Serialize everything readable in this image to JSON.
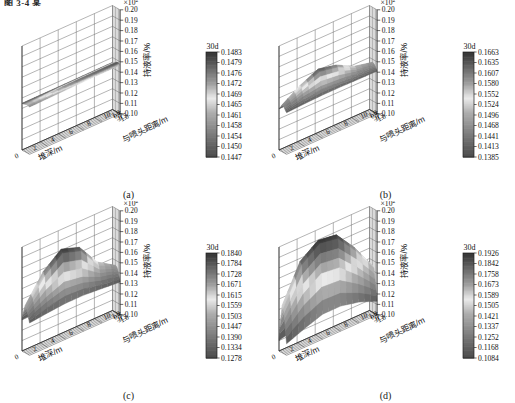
{
  "figure": {
    "cropped_header": "图 3-4 某  ",
    "axis_labels": {
      "x": "堆深/m",
      "y": "与喷头距离/m",
      "z": "持液率/%"
    },
    "z_multiplier": "×10",
    "z_multiplier_exp": "2",
    "x_ticks": [
      "0",
      "2",
      "4",
      "6",
      "8",
      "10"
    ],
    "y_ticks": [
      "1.0",
      "0.5",
      "0",
      "-0.5",
      "-1.0"
    ],
    "z_ticks": [
      "0.20",
      "0.19",
      "0.18",
      "0.17",
      "0.16",
      "0.15",
      "0.14",
      "0.13",
      "0.12",
      "0.11",
      "0.10"
    ],
    "colorbar_title": "30d"
  },
  "chart_data": [
    {
      "type": "heatmap",
      "panel": "a",
      "caption": "(a)",
      "title": "",
      "xlabel": "堆深/m",
      "ylabel": "与喷头距离/m",
      "zlabel": "持液率/%",
      "xlim": [
        0,
        10
      ],
      "ylim": [
        -1.0,
        1.0
      ],
      "zlim": [
        0.1,
        0.2
      ],
      "z_scale": "x10^2",
      "grid": true,
      "legend": "30d",
      "colorbar_ticks": [
        0.1483,
        0.1479,
        0.1476,
        0.1472,
        0.1469,
        0.1465,
        0.1461,
        0.1458,
        0.1454,
        0.145,
        0.1447
      ],
      "colorbar_min": 0.1447,
      "colorbar_max": 0.1483,
      "surface_description": "nearly flat plane at approximately 0.145-0.148, slight rise at the near-left corner",
      "surface_z_values": [
        [
          0.145,
          0.145,
          0.1451,
          0.1452,
          0.1453,
          0.1454
        ],
        [
          0.1452,
          0.1453,
          0.1455,
          0.1457,
          0.1458,
          0.1459
        ],
        [
          0.1458,
          0.1462,
          0.1466,
          0.1468,
          0.1469,
          0.147
        ],
        [
          0.1462,
          0.1468,
          0.1474,
          0.1477,
          0.1478,
          0.1479
        ],
        [
          0.146,
          0.1466,
          0.1472,
          0.1476,
          0.1478,
          0.148
        ],
        [
          0.1455,
          0.1458,
          0.1462,
          0.1465,
          0.1467,
          0.1469
        ]
      ]
    },
    {
      "type": "heatmap",
      "panel": "b",
      "caption": "(b)",
      "title": "",
      "xlabel": "堆深/m",
      "ylabel": "与喷头距离/m",
      "zlabel": "持液率/%",
      "xlim": [
        0,
        10
      ],
      "ylim": [
        -1.0,
        1.0
      ],
      "zlim": [
        0.1,
        0.2
      ],
      "z_scale": "x10^2",
      "grid": true,
      "legend": "30d",
      "colorbar_ticks": [
        0.1663,
        0.1635,
        0.1607,
        0.158,
        0.1552,
        0.1524,
        0.1496,
        0.1468,
        0.1441,
        0.1413,
        0.1385
      ],
      "colorbar_min": 0.1385,
      "colorbar_max": 0.1663,
      "surface_description": "localized peak near shallow depth at the nozzle centre, decaying to a flat plateau",
      "surface_z_values": [
        [
          0.1395,
          0.14,
          0.1405,
          0.1408,
          0.141,
          0.1412
        ],
        [
          0.142,
          0.146,
          0.148,
          0.147,
          0.145,
          0.1435
        ],
        [
          0.145,
          0.156,
          0.164,
          0.16,
          0.151,
          0.147
        ],
        [
          0.1445,
          0.154,
          0.162,
          0.1585,
          0.15,
          0.1465
        ],
        [
          0.142,
          0.1465,
          0.149,
          0.1478,
          0.1455,
          0.144
        ],
        [
          0.14,
          0.1408,
          0.1415,
          0.1415,
          0.1412,
          0.141
        ]
      ]
    },
    {
      "type": "heatmap",
      "panel": "c",
      "caption": "(c)",
      "title": "",
      "xlabel": "堆深/m",
      "ylabel": "与喷头距离/m",
      "zlabel": "持液率/%",
      "xlim": [
        0,
        10
      ],
      "ylim": [
        -1.0,
        1.0
      ],
      "zlim": [
        0.1,
        0.2
      ],
      "z_scale": "x10^2",
      "grid": true,
      "legend": "30d",
      "colorbar_ticks": [
        0.184,
        0.1784,
        0.1728,
        0.1671,
        0.1615,
        0.1559,
        0.1503,
        0.1447,
        0.139,
        0.1334,
        0.1278
      ],
      "colorbar_min": 0.1278,
      "colorbar_max": 0.184,
      "surface_description": "tall narrow ridge at shallow depth decaying exponentially with depth; low flat tail",
      "surface_z_values": [
        [
          0.13,
          0.131,
          0.132,
          0.1325,
          0.132,
          0.131
        ],
        [
          0.138,
          0.152,
          0.162,
          0.157,
          0.145,
          0.139
        ],
        [
          0.145,
          0.17,
          0.184,
          0.178,
          0.156,
          0.145
        ],
        [
          0.143,
          0.166,
          0.181,
          0.175,
          0.153,
          0.144
        ],
        [
          0.137,
          0.147,
          0.154,
          0.151,
          0.143,
          0.139
        ],
        [
          0.131,
          0.133,
          0.1345,
          0.1345,
          0.133,
          0.1315
        ]
      ]
    },
    {
      "type": "heatmap",
      "panel": "d",
      "caption": "(d)",
      "title": "",
      "xlabel": "堆深/m",
      "ylabel": "与喷头距离/m",
      "zlabel": "持液率/%",
      "xlim": [
        0,
        10
      ],
      "ylim": [
        -1.0,
        1.0
      ],
      "zlim": [
        0.1,
        0.2
      ],
      "z_scale": "x10^2",
      "grid": true,
      "legend": "30d",
      "colorbar_ticks": [
        0.1926,
        0.1842,
        0.1758,
        0.1673,
        0.1589,
        0.1505,
        0.1421,
        0.1337,
        0.1252,
        0.1168,
        0.1084
      ],
      "colorbar_min": 0.1084,
      "colorbar_max": 0.1926,
      "surface_description": "broad saddle: high plateau over shallow depth falling off steeply toward both distance extremes",
      "surface_z_values": [
        [
          0.11,
          0.115,
          0.12,
          0.121,
          0.118,
          0.112
        ],
        [
          0.13,
          0.16,
          0.18,
          0.176,
          0.15,
          0.13
        ],
        [
          0.145,
          0.18,
          0.1926,
          0.19,
          0.17,
          0.145
        ],
        [
          0.143,
          0.177,
          0.19,
          0.187,
          0.167,
          0.143
        ],
        [
          0.128,
          0.15,
          0.162,
          0.16,
          0.145,
          0.128
        ],
        [
          0.111,
          0.118,
          0.124,
          0.124,
          0.12,
          0.113
        ]
      ]
    }
  ]
}
